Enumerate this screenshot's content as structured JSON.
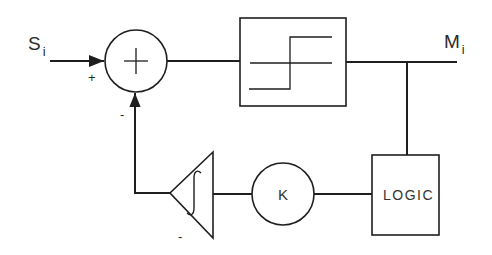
{
  "diagram": {
    "type": "control-loop block diagram",
    "input": {
      "symbol": "S",
      "subscript": "i"
    },
    "output": {
      "symbol": "M",
      "subscript": "i"
    },
    "summing_junction": {
      "symbol": "+",
      "input_sign_main": "+",
      "input_sign_feedback": "-"
    },
    "relay_block": {
      "description": "relay / hysteresis step nonlinearity"
    },
    "logic_block": {
      "label": "LOGIC"
    },
    "gain_block": {
      "label": "K"
    },
    "integrator_block": {
      "symbol": "∫",
      "sign": "-"
    },
    "colors": {
      "line": "#1e1e1e",
      "background": "#ffffff"
    }
  }
}
